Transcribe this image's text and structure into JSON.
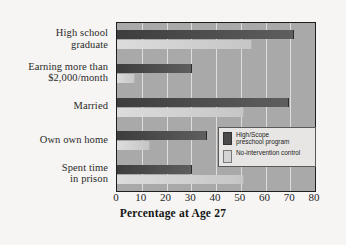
{
  "chart_data": {
    "type": "bar",
    "orientation": "horizontal",
    "title": "",
    "xlabel": "Percentage at Age 27",
    "ylabel": "",
    "xlim": [
      0,
      80
    ],
    "xticks": [
      0,
      10,
      20,
      30,
      40,
      50,
      60,
      70,
      80
    ],
    "grid": true,
    "legend_position": "inside-right",
    "categories": [
      "High school\ngraduate",
      "Earning more than\n$2,000/month",
      "Married",
      "Own own home",
      "Spent time\nin prison"
    ],
    "category_lines": [
      [
        "High school",
        "graduate"
      ],
      [
        "Earning more than",
        "$2,000/month"
      ],
      [
        "Married"
      ],
      [
        "Own own home"
      ],
      [
        "Spent time",
        "in prison"
      ]
    ],
    "series": [
      {
        "name": "High/Scope preschool program",
        "color": "#4a4a4a",
        "values": [
          71,
          30,
          69,
          36,
          30
        ]
      },
      {
        "name": "No-intervention control",
        "color": "#d4d4d4",
        "values": [
          54,
          7,
          51,
          13,
          51
        ]
      }
    ]
  },
  "legend": {
    "items": [
      {
        "label_line1": "High/Scope",
        "label_line2": "preschool program",
        "swatch": "program"
      },
      {
        "label_line1": "No-intervention control",
        "label_line2": "",
        "swatch": "control"
      }
    ]
  },
  "colors": {
    "page_background": "#f6f5f3",
    "plot_background": "#a9a9a9",
    "gridline": "#e6e6e6",
    "axis_frame": "#1e1e1e",
    "program_bar": "#4a4a4a",
    "control_bar": "#d4d4d4",
    "text": "#2a2a2a"
  }
}
